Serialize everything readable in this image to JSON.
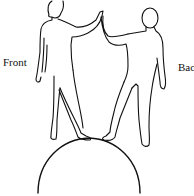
{
  "figure": {
    "labels": {
      "front": "Front",
      "back": "Bac"
    },
    "elements": {
      "left_figure": "person-front-view",
      "right_figure": "person-back-view",
      "support": "semicircle-arc"
    },
    "colors": {
      "line": "#111111",
      "background": "#ffffff"
    }
  }
}
